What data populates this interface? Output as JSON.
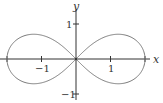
{
  "chart_data": {
    "type": "line",
    "title": "",
    "curve": "lemniscate of Bernoulli",
    "equation": "(x^2 + y^2)^2 = 4(x^2 - y^2)",
    "parameter_a": 2,
    "xlabel": "x",
    "ylabel": "y",
    "xlim": [
      -2.2,
      2.15
    ],
    "ylim": [
      -1.2,
      1.4
    ],
    "x_ticks": [
      {
        "value": -1,
        "label": "−1"
      },
      {
        "value": 1,
        "label": "1"
      }
    ],
    "y_ticks": [
      {
        "value": 1,
        "label": "1"
      },
      {
        "value": -1,
        "label": "−1"
      }
    ],
    "grid": false,
    "legend": null,
    "series": [
      {
        "name": "lemniscate",
        "points": [
          [
            2.0,
            0.0
          ],
          [
            1.96,
            0.27
          ],
          [
            1.85,
            0.49
          ],
          [
            1.68,
            0.64
          ],
          [
            1.47,
            0.71
          ],
          [
            1.22,
            0.71
          ],
          [
            0.97,
            0.63
          ],
          [
            0.72,
            0.5
          ],
          [
            0.47,
            0.34
          ],
          [
            0.23,
            0.17
          ],
          [
            0.0,
            0.0
          ],
          [
            -0.23,
            -0.17
          ],
          [
            -0.47,
            -0.34
          ],
          [
            -0.72,
            -0.5
          ],
          [
            -0.97,
            -0.63
          ],
          [
            -1.22,
            -0.71
          ],
          [
            -1.47,
            -0.71
          ],
          [
            -1.68,
            -0.64
          ],
          [
            -1.85,
            -0.49
          ],
          [
            -1.96,
            -0.27
          ],
          [
            -2.0,
            0.0
          ],
          [
            -1.96,
            0.27
          ],
          [
            -1.85,
            0.49
          ],
          [
            -1.68,
            0.64
          ],
          [
            -1.47,
            0.71
          ],
          [
            -1.22,
            0.71
          ],
          [
            -0.97,
            0.63
          ],
          [
            -0.72,
            0.5
          ],
          [
            -0.47,
            0.34
          ],
          [
            -0.23,
            0.17
          ],
          [
            0.0,
            0.0
          ],
          [
            0.23,
            -0.17
          ],
          [
            0.47,
            -0.34
          ],
          [
            0.72,
            -0.5
          ],
          [
            0.97,
            -0.63
          ],
          [
            1.22,
            -0.71
          ],
          [
            1.47,
            -0.71
          ],
          [
            1.68,
            -0.64
          ],
          [
            1.85,
            -0.49
          ],
          [
            1.96,
            -0.27
          ],
          [
            2.0,
            0.0
          ]
        ]
      }
    ],
    "key_points": {
      "x_intercepts": [
        -2,
        0,
        2
      ],
      "max_y": 0.707,
      "min_y": -0.707
    }
  },
  "colors": {
    "axis": "#333333",
    "curve": "#7a7a7a",
    "background": "#ffffff"
  },
  "layout": {
    "origin_px": [
      76,
      59
    ],
    "px_per_unit_x": 34.5,
    "px_per_unit_y": 35
  }
}
